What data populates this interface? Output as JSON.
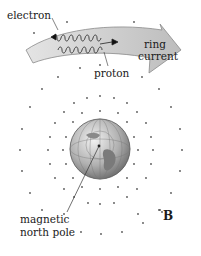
{
  "diagram": {
    "labels": {
      "electron": "electron",
      "proton": "proton",
      "ring_current_line1": "ring",
      "ring_current_line2": "current",
      "magnetic_line1": "magnetic",
      "magnetic_line2": "north pole",
      "field": "B"
    },
    "colors": {
      "band_fill": "#c8c8c8",
      "band_stroke": "#8a8a8a",
      "dot": "#555555",
      "globe_light": "#e8e8e8",
      "globe_dark": "#6a6a6a",
      "text": "#1a1a1a"
    },
    "elements": [
      "ring-current-arrow",
      "electron-helix",
      "proton-helix",
      "earth-globe",
      "magnetic-field-dots"
    ]
  }
}
